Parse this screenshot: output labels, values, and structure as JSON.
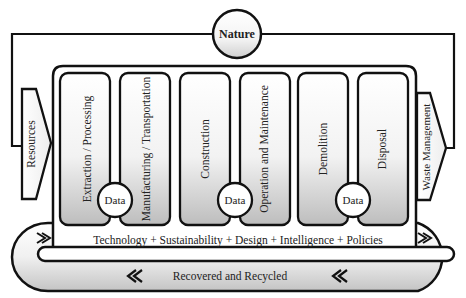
{
  "diagram": {
    "type": "lifecycle-flow",
    "nature": {
      "label": "Nature"
    },
    "input_arrow": {
      "label": "Resources"
    },
    "output_arrow": {
      "label": "Waste Management"
    },
    "stages": [
      {
        "label": "Extraction / Processing"
      },
      {
        "label": "Manufacturing / Transportation"
      },
      {
        "label": "Construction"
      },
      {
        "label": "Operation and Maintenance"
      },
      {
        "label": "Demolition"
      },
      {
        "label": "Disposal"
      }
    ],
    "data_nodes": [
      {
        "label": "Data"
      },
      {
        "label": "Data"
      },
      {
        "label": "Data"
      }
    ],
    "enablers": {
      "label": "Technology + Sustainability + Design + Intelligence + Policies"
    },
    "recycle_loop": {
      "label": "Recovered and Recycled"
    },
    "colors": {
      "stroke": "#111111",
      "fill_light": "#ffffff",
      "fill_dark": "#c8c8c8"
    }
  }
}
